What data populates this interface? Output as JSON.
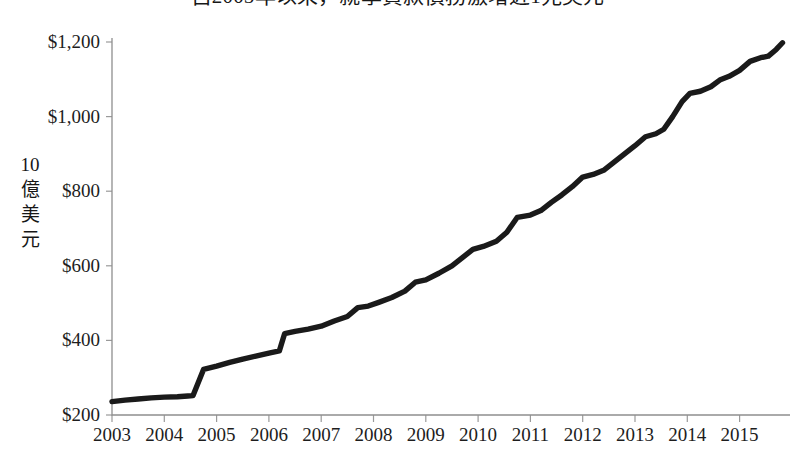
{
  "chart_data": {
    "type": "line",
    "title": "自2005年以來，就學貸款債務激增近1兆美元",
    "xlabel": "",
    "ylabel": "10億美元",
    "ylabel_chars": [
      "10",
      "億",
      "美",
      "元"
    ],
    "ylim": [
      200,
      1200
    ],
    "xlim": [
      2003,
      2015.75
    ],
    "grid": false,
    "legend": null,
    "line_color": "#1a1a1a",
    "axis_color": "#8f8f8f",
    "y_ticks": [
      1200,
      1000,
      800,
      600,
      400,
      200
    ],
    "y_tick_labels": [
      "$1,200",
      "$1,000",
      "$800",
      "$600",
      "$400",
      "$200"
    ],
    "x_ticks": [
      2003,
      2004,
      2005,
      2006,
      2007,
      2008,
      2009,
      2010,
      2011,
      2012,
      2013,
      2014,
      2015
    ],
    "x_tick_labels": [
      "2003",
      "2004",
      "2005",
      "2006",
      "2007",
      "2008",
      "2009",
      "2010",
      "2011",
      "2012",
      "2013",
      "2014",
      "2015"
    ],
    "series": [
      {
        "name": "學生貸款債務餘額",
        "unit": "10億美元",
        "x": [
          2003.0,
          2003.25,
          2003.5,
          2003.75,
          2004.0,
          2004.25,
          2004.5,
          2004.75,
          2005.0,
          2005.25,
          2005.5,
          2005.75,
          2006.0,
          2006.25,
          2006.5,
          2006.75,
          2007.0,
          2007.25,
          2007.5,
          2007.75,
          2008.0,
          2008.25,
          2008.5,
          2008.75,
          2009.0,
          2009.25,
          2009.5,
          2009.75,
          2010.0,
          2010.25,
          2010.5,
          2010.75,
          2011.0,
          2011.25,
          2011.5,
          2011.75,
          2012.0,
          2012.25,
          2012.5,
          2012.75,
          2013.0,
          2013.25,
          2013.5,
          2013.75,
          2014.0,
          2014.25,
          2014.5,
          2014.75,
          2015.0,
          2015.25,
          2015.5,
          2015.75
        ],
        "values": [
          236,
          240,
          243,
          246,
          248,
          250,
          253,
          324,
          330,
          338,
          345,
          352,
          358,
          364,
          372,
          418,
          424,
          430,
          442,
          455,
          466,
          477,
          489,
          500,
          512,
          525,
          538,
          552,
          566,
          578,
          590,
          603,
          620,
          634,
          645,
          658,
          672,
          688,
          706,
          730,
          738,
          745,
          760,
          778,
          795,
          812,
          828,
          844,
          851,
          866,
          886,
          905
        ]
      }
    ]
  },
  "series_points": [
    {
      "x": 2003.0,
      "y": 236
    },
    {
      "x": 2003.25,
      "y": 240
    },
    {
      "x": 2003.5,
      "y": 243
    },
    {
      "x": 2003.75,
      "y": 246
    },
    {
      "x": 2004.0,
      "y": 248
    },
    {
      "x": 2004.25,
      "y": 249
    },
    {
      "x": 2004.45,
      "y": 251
    },
    {
      "x": 2004.55,
      "y": 252
    },
    {
      "x": 2004.75,
      "y": 322
    },
    {
      "x": 2005.0,
      "y": 331
    },
    {
      "x": 2005.25,
      "y": 341
    },
    {
      "x": 2005.5,
      "y": 350
    },
    {
      "x": 2005.75,
      "y": 358
    },
    {
      "x": 2006.0,
      "y": 366
    },
    {
      "x": 2006.2,
      "y": 372
    },
    {
      "x": 2006.3,
      "y": 418
    },
    {
      "x": 2006.5,
      "y": 424
    },
    {
      "x": 2006.75,
      "y": 430
    },
    {
      "x": 2007.0,
      "y": 438
    },
    {
      "x": 2007.25,
      "y": 452
    },
    {
      "x": 2007.5,
      "y": 464
    },
    {
      "x": 2007.7,
      "y": 488
    },
    {
      "x": 2007.9,
      "y": 492
    },
    {
      "x": 2008.1,
      "y": 502
    },
    {
      "x": 2008.35,
      "y": 515
    },
    {
      "x": 2008.6,
      "y": 532
    },
    {
      "x": 2008.8,
      "y": 556
    },
    {
      "x": 2009.0,
      "y": 562
    },
    {
      "x": 2009.25,
      "y": 580
    },
    {
      "x": 2009.5,
      "y": 600
    },
    {
      "x": 2009.7,
      "y": 622
    },
    {
      "x": 2009.9,
      "y": 644
    },
    {
      "x": 2010.1,
      "y": 652
    },
    {
      "x": 2010.35,
      "y": 666
    },
    {
      "x": 2010.55,
      "y": 690
    },
    {
      "x": 2010.75,
      "y": 730
    },
    {
      "x": 2011.0,
      "y": 736
    },
    {
      "x": 2011.2,
      "y": 748
    },
    {
      "x": 2011.4,
      "y": 770
    },
    {
      "x": 2011.6,
      "y": 790
    },
    {
      "x": 2011.8,
      "y": 812
    },
    {
      "x": 2012.0,
      "y": 838
    },
    {
      "x": 2012.2,
      "y": 845
    },
    {
      "x": 2012.4,
      "y": 856
    },
    {
      "x": 2012.6,
      "y": 878
    },
    {
      "x": 2012.8,
      "y": 900
    },
    {
      "x": 2013.0,
      "y": 922
    },
    {
      "x": 2013.2,
      "y": 946
    },
    {
      "x": 2013.4,
      "y": 954
    },
    {
      "x": 2013.55,
      "y": 966
    },
    {
      "x": 2013.72,
      "y": 1000
    },
    {
      "x": 2013.9,
      "y": 1040
    },
    {
      "x": 2014.05,
      "y": 1062
    },
    {
      "x": 2014.25,
      "y": 1068
    },
    {
      "x": 2014.45,
      "y": 1080
    },
    {
      "x": 2014.62,
      "y": 1098
    },
    {
      "x": 2014.8,
      "y": 1108
    },
    {
      "x": 2015.0,
      "y": 1124
    },
    {
      "x": 2015.2,
      "y": 1148
    },
    {
      "x": 2015.4,
      "y": 1158
    },
    {
      "x": 2015.55,
      "y": 1162
    },
    {
      "x": 2015.7,
      "y": 1180
    },
    {
      "x": 2015.82,
      "y": 1198
    }
  ]
}
